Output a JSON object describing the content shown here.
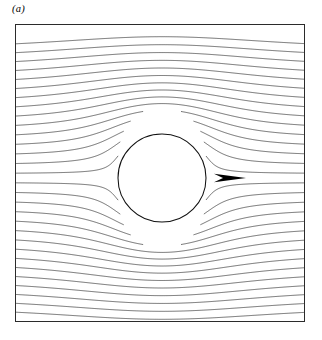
{
  "figure": {
    "panel_label": "(a)",
    "background_color": "#ffffff",
    "frame_color": "#2b2b2b",
    "streamline_color": "#1a1a1a",
    "cylinder_edge_color": "#111111",
    "cylinder_fill_color": "#ffffff",
    "arrow_color": "#000000"
  },
  "chart_data": {
    "type": "line",
    "title": "(a)",
    "subtitle": "",
    "xlabel": "",
    "ylabel": "",
    "plot_kind": "streamline-contour",
    "grid": false,
    "legend": false,
    "legend_position": "none",
    "axis_ticks": false,
    "tick_labels": [],
    "xlim": [
      -3.3,
      3.3
    ],
    "ylim": [
      -3.4,
      3.4
    ],
    "frame": {
      "left_px": 15,
      "top_px": 24,
      "width_px": 290,
      "height_px": 298
    },
    "obstacle": {
      "shape": "circle",
      "center_x_px": 162,
      "center_y_px": 178,
      "radius_px": 44,
      "center_data": [
        0.0,
        0.0
      ],
      "radius_data": 1.0,
      "filled": false
    },
    "flow_arrow": {
      "direction": "right",
      "tip_x_px": 246,
      "tail_x_px": 214,
      "y_px": 178,
      "length_px": 32,
      "meaning": "free-stream flow direction, left to right"
    },
    "streamlines": {
      "count": 30,
      "inlet_edge": "left",
      "outlet_edge": "right",
      "inlet_spacing_px": 10,
      "inlet_y_start_px": 24,
      "symmetry": "mirror-symmetric about horizontal centerline y = 178 px",
      "psi_values": [
        -2.9,
        -2.7,
        -2.5,
        -2.3,
        -2.1,
        -1.9,
        -1.7,
        -1.5,
        -1.3,
        -1.1,
        -0.9,
        -0.7,
        -0.5,
        -0.3,
        -0.1,
        0.1,
        0.3,
        0.5,
        0.7,
        0.9,
        1.1,
        1.3,
        1.5,
        1.7,
        1.9,
        2.1,
        2.3,
        2.5,
        2.7,
        2.9
      ],
      "notes": "Uniform oncoming stream deflects around the cylinder; lines compress over the top and bottom of the body and relax back to uniform spacing far downstream. Near the top and bottom frame edges the lines bow toward the mid-plane, crossing the bottom border at steep angles close to the corners."
    }
  }
}
